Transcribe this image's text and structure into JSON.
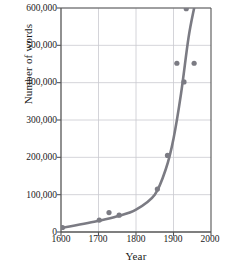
{
  "chart_data": {
    "type": "scatter",
    "title": "",
    "xlabel": "Year",
    "ylabel": "Number of words",
    "xlim": [
      1600,
      2000
    ],
    "ylim": [
      0,
      600000
    ],
    "xticks": [
      1600,
      1700,
      1800,
      1900,
      2000
    ],
    "xtick_labels": [
      "1600",
      "1700",
      "1800",
      "1900",
      "2000"
    ],
    "yticks": [
      0,
      100000,
      200000,
      300000,
      400000,
      500000,
      600000
    ],
    "ytick_labels": [
      "0",
      "100,000",
      "200,000",
      "300,000",
      "400,000",
      "500,000",
      "600,000"
    ],
    "grid": true,
    "legend": "none",
    "series": [
      {
        "name": "Number of words in dictionary",
        "marker": "circle",
        "color": "#7b7b83",
        "points": [
          {
            "x": 1604,
            "y": 12000
          },
          {
            "x": 1702,
            "y": 32000
          },
          {
            "x": 1728,
            "y": 52000
          },
          {
            "x": 1755,
            "y": 45000
          },
          {
            "x": 1857,
            "y": 115000
          },
          {
            "x": 1884,
            "y": 205000
          },
          {
            "x": 1909,
            "y": 452000
          },
          {
            "x": 1928,
            "y": 402000
          },
          {
            "x": 1934,
            "y": 598000
          },
          {
            "x": 1955,
            "y": 452000
          }
        ]
      },
      {
        "name": "Exponential fit curve",
        "marker": "line",
        "color": "#7b7b83",
        "points": [
          {
            "x": 1600,
            "y": 10000
          },
          {
            "x": 1700,
            "y": 30000
          },
          {
            "x": 1750,
            "y": 42000
          },
          {
            "x": 1800,
            "y": 60000
          },
          {
            "x": 1850,
            "y": 100000
          },
          {
            "x": 1880,
            "y": 170000
          },
          {
            "x": 1900,
            "y": 250000
          },
          {
            "x": 1920,
            "y": 370000
          },
          {
            "x": 1940,
            "y": 520000
          },
          {
            "x": 1955,
            "y": 600000
          }
        ]
      }
    ],
    "colors": {
      "data": "#7b7b83",
      "axis": "#555555",
      "grid": "#c9c9cf",
      "text": "#1a1a1a",
      "background": "#ffffff"
    }
  }
}
